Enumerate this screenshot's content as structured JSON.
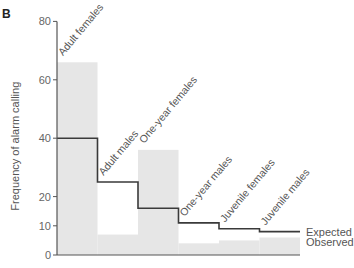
{
  "panel_label": "B",
  "colors": {
    "observed_bar": "#e6e6e6",
    "expected_line": "#3a3a3a",
    "axis": "#555555"
  },
  "chart_data": {
    "type": "bar",
    "title": "",
    "xlabel": "",
    "ylabel": "Frequency of alarm calling",
    "ylim": [
      0,
      80
    ],
    "yticks": [
      0,
      10,
      20,
      40,
      60,
      80
    ],
    "grid": false,
    "legend_position": "right, inline labels",
    "categories": [
      "Adult females",
      "Adult males",
      "One-year females",
      "One-year males",
      "Juvenile females",
      "Juvenile males"
    ],
    "series": [
      {
        "name": "Observed",
        "style": "shaded bars",
        "values": [
          66,
          7,
          36,
          4,
          5,
          6
        ]
      },
      {
        "name": "Expected",
        "style": "step line",
        "values": [
          40,
          25,
          16,
          11,
          9,
          8
        ]
      }
    ]
  }
}
